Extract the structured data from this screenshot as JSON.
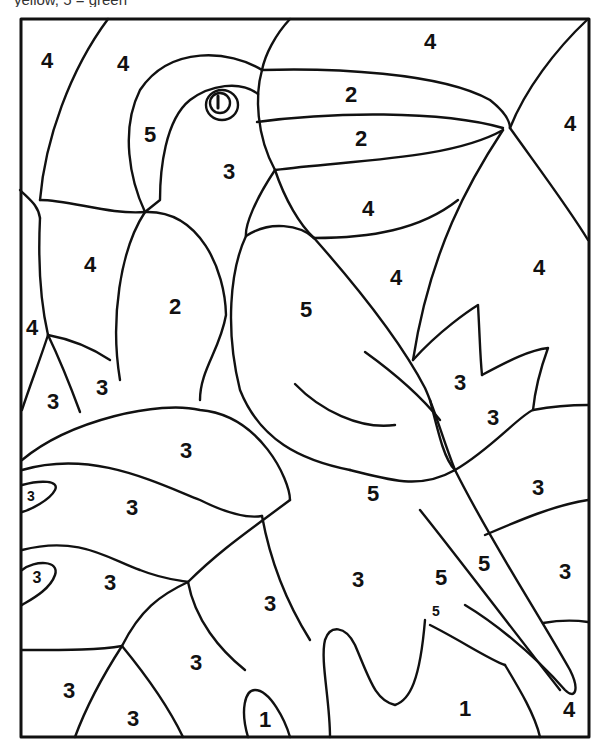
{
  "header": {
    "partial_text": "yellow, 5 = green"
  },
  "page": {
    "frame": {
      "x": 21,
      "y": 19,
      "w": 568,
      "h": 718
    }
  },
  "labels": [
    {
      "id": "sky-top-left",
      "n": "4",
      "x": 47,
      "y": 62,
      "size": 22
    },
    {
      "id": "sky-top-left-2",
      "n": "4",
      "x": 123,
      "y": 65,
      "size": 22
    },
    {
      "id": "sky-top",
      "n": "4",
      "x": 430,
      "y": 43,
      "size": 22
    },
    {
      "id": "beak-upper",
      "n": "2",
      "x": 351,
      "y": 96,
      "size": 22
    },
    {
      "id": "beak-lower",
      "n": "2",
      "x": 361,
      "y": 140,
      "size": 22
    },
    {
      "id": "sky-right",
      "n": "4",
      "x": 570,
      "y": 125,
      "size": 22
    },
    {
      "id": "head-back",
      "n": "5",
      "x": 150,
      "y": 136,
      "size": 22
    },
    {
      "id": "face",
      "n": "3",
      "x": 229,
      "y": 173,
      "size": 22
    },
    {
      "id": "sky-under-beak",
      "n": "4",
      "x": 368,
      "y": 210,
      "size": 22
    },
    {
      "id": "sky-left-mid",
      "n": "4",
      "x": 90,
      "y": 266,
      "size": 22
    },
    {
      "id": "chest",
      "n": "2",
      "x": 175,
      "y": 308,
      "size": 22
    },
    {
      "id": "wing",
      "n": "5",
      "x": 306,
      "y": 311,
      "size": 22
    },
    {
      "id": "sky-center-right",
      "n": "4",
      "x": 396,
      "y": 279,
      "size": 22
    },
    {
      "id": "sky-far-right",
      "n": "4",
      "x": 539,
      "y": 269,
      "size": 22
    },
    {
      "id": "sky-left-edge",
      "n": "4",
      "x": 32,
      "y": 329,
      "size": 22
    },
    {
      "id": "leaf-left-1",
      "n": "3",
      "x": 53,
      "y": 403,
      "size": 22
    },
    {
      "id": "leaf-left-2",
      "n": "3",
      "x": 102,
      "y": 389,
      "size": 22
    },
    {
      "id": "leaf-right-1",
      "n": "3",
      "x": 460,
      "y": 384,
      "size": 22
    },
    {
      "id": "leaf-right-2",
      "n": "3",
      "x": 493,
      "y": 419,
      "size": 22
    },
    {
      "id": "leaf-big-1",
      "n": "3",
      "x": 186,
      "y": 452,
      "size": 22
    },
    {
      "id": "leaf-tiny-1",
      "n": "3",
      "x": 31,
      "y": 497,
      "size": 14
    },
    {
      "id": "leaf-big-2",
      "n": "3",
      "x": 132,
      "y": 509,
      "size": 22
    },
    {
      "id": "tail-top",
      "n": "5",
      "x": 373,
      "y": 495,
      "size": 22
    },
    {
      "id": "leaf-right-3",
      "n": "3",
      "x": 538,
      "y": 489,
      "size": 22
    },
    {
      "id": "leaf-tiny-2",
      "n": "3",
      "x": 37,
      "y": 579,
      "size": 16
    },
    {
      "id": "leaf-big-3",
      "n": "3",
      "x": 110,
      "y": 584,
      "size": 22
    },
    {
      "id": "leaf-center",
      "n": "3",
      "x": 270,
      "y": 605,
      "size": 22
    },
    {
      "id": "leaf-center-2",
      "n": "3",
      "x": 358,
      "y": 581,
      "size": 22
    },
    {
      "id": "tail-mid-1",
      "n": "5",
      "x": 441,
      "y": 579,
      "size": 22
    },
    {
      "id": "tail-mid-2",
      "n": "5",
      "x": 484,
      "y": 565,
      "size": 22
    },
    {
      "id": "leaf-right-4",
      "n": "3",
      "x": 565,
      "y": 573,
      "size": 22
    },
    {
      "id": "tail-small",
      "n": "5",
      "x": 436,
      "y": 612,
      "size": 14
    },
    {
      "id": "leaf-bottom-1",
      "n": "3",
      "x": 196,
      "y": 664,
      "size": 22
    },
    {
      "id": "leaf-bottom-left",
      "n": "3",
      "x": 69,
      "y": 692,
      "size": 22
    },
    {
      "id": "leaf-bottom-2",
      "n": "3",
      "x": 133,
      "y": 720,
      "size": 22
    },
    {
      "id": "branch-small",
      "n": "1",
      "x": 265,
      "y": 721,
      "size": 22
    },
    {
      "id": "branch-big",
      "n": "1",
      "x": 465,
      "y": 710,
      "size": 22
    },
    {
      "id": "sky-bottom-right",
      "n": "4",
      "x": 569,
      "y": 711,
      "size": 22
    }
  ],
  "colors": {
    "line": "#111111",
    "paper": "#ffffff",
    "header_text": "#333333"
  }
}
